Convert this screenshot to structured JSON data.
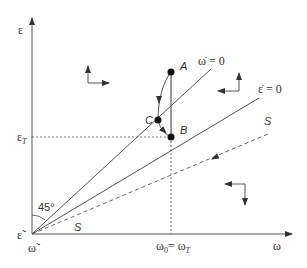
{
  "diagram": {
    "axes": {
      "y_label": "ε",
      "x_label": "ω",
      "origin_y_label": "ε̃",
      "origin_x_label": "ω̃"
    },
    "ticks": {
      "eps_T": "ε",
      "eps_T_sub": "T",
      "omega_0": "ω",
      "omega_0_sub": "0",
      "omega_eq": "= ω",
      "omega_T_sub": "T"
    },
    "lines": {
      "omega_dot_zero": "ω̇ = 0",
      "eps_dot_zero": "ε̇ = 0",
      "saddle_upper": "S",
      "saddle_lower": "S"
    },
    "points": {
      "A": "A",
      "B": "B",
      "C": "C"
    },
    "angle_label": "45°",
    "colors": {
      "line": "#555555",
      "point": "#111111",
      "text": "#333333"
    }
  }
}
